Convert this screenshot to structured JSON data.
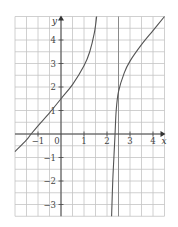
{
  "chart_data": {
    "type": "line",
    "title": "",
    "xlabel": "x",
    "ylabel": "y",
    "xlim": [
      -2,
      4.5
    ],
    "ylim": [
      -3.5,
      5
    ],
    "grid": true,
    "grid_step": 0.5,
    "x_ticks": [
      {
        "value": -1,
        "label": "−1"
      },
      {
        "value": 0,
        "label": "0"
      },
      {
        "value": 1,
        "label": "1"
      },
      {
        "value": 2,
        "label": "2"
      },
      {
        "value": 3,
        "label": "3"
      },
      {
        "value": 4,
        "label": "4"
      }
    ],
    "y_ticks": [
      {
        "value": 4,
        "label": "4"
      },
      {
        "value": 3,
        "label": "3"
      },
      {
        "value": 2,
        "label": "2"
      },
      {
        "value": 1,
        "label": "1"
      },
      {
        "value": -1,
        "label": "−1"
      },
      {
        "value": -2,
        "label": "−2"
      },
      {
        "value": -3,
        "label": "−3"
      }
    ],
    "series": [
      {
        "name": "left-branch",
        "points": [
          [
            -2,
            -0.75
          ],
          [
            -1.5,
            -0.25
          ],
          [
            -1.3,
            0
          ],
          [
            -1,
            0.35
          ],
          [
            -0.5,
            0.9
          ],
          [
            0,
            1.5
          ],
          [
            0.5,
            2.1
          ],
          [
            1,
            2.9
          ],
          [
            1.25,
            3.5
          ],
          [
            1.45,
            4.3
          ],
          [
            1.55,
            5
          ]
        ]
      },
      {
        "name": "right-branch",
        "points": [
          [
            2.2,
            -3.5
          ],
          [
            2.25,
            -2
          ],
          [
            2.3,
            -1
          ],
          [
            2.35,
            0
          ],
          [
            2.4,
            1
          ],
          [
            2.5,
            1.8
          ],
          [
            2.75,
            2.6
          ],
          [
            3,
            3.1
          ],
          [
            3.5,
            3.8
          ],
          [
            4,
            4.4
          ],
          [
            4.5,
            5
          ]
        ]
      }
    ],
    "asymptote_x": 2.5
  }
}
